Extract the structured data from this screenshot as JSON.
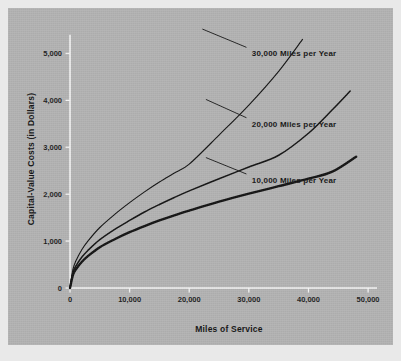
{
  "figure": {
    "panel_color": "#b2b2b2",
    "page_color": "#e9e9e9",
    "axis_color": "#f4f4f4",
    "ink_color": "#121212"
  },
  "chart_data": {
    "type": "line",
    "title": "",
    "subtitle": "",
    "xlabel": "Miles of Service",
    "ylabel": "Capital-Value Costs (in Dollars)",
    "xlim": [
      0,
      52000
    ],
    "ylim": [
      0,
      5500
    ],
    "xticks": [
      0,
      10000,
      20000,
      30000,
      40000,
      50000
    ],
    "xticklabels": [
      "0",
      "10,000",
      "20,000",
      "30,000",
      "40,000",
      "50,000"
    ],
    "yticks": [
      0,
      1000,
      2000,
      3000,
      4000,
      5000
    ],
    "yticklabels": [
      "0",
      "1,000",
      "2,000",
      "3,000",
      "4,000",
      "5,000"
    ],
    "grid": false,
    "legend_position": "inline-annotations",
    "series": [
      {
        "name": "10,000 Miles per Year",
        "label": "10,000 Miles per Year",
        "stroke_width": 2.4,
        "label_x": 30500,
        "label_y": 2300,
        "leader_from": [
          29600,
          2430
        ],
        "leader_to": [
          22800,
          2780
        ],
        "x": [
          0,
          500,
          1000,
          2000,
          3000,
          5000,
          7500,
          10000,
          12500,
          15000,
          17500,
          20000,
          25000,
          30000,
          35000,
          40000,
          44000,
          48000
        ],
        "y": [
          0,
          280,
          400,
          560,
          680,
          870,
          1040,
          1190,
          1320,
          1440,
          1550,
          1650,
          1840,
          2010,
          2170,
          2330,
          2480,
          2800
        ]
      },
      {
        "name": "20,000 Miles per Year",
        "label": "20,000 Miles per Year",
        "stroke_width": 1.5,
        "label_x": 30500,
        "label_y": 3500,
        "leader_from": [
          29600,
          3630
        ],
        "leader_to": [
          22800,
          4020
        ],
        "x": [
          0,
          500,
          1000,
          2000,
          3000,
          5000,
          7500,
          10000,
          12500,
          15000,
          17500,
          20000,
          25000,
          30000,
          35000,
          40000,
          44000,
          47000
        ],
        "y": [
          0,
          330,
          470,
          660,
          800,
          1030,
          1250,
          1440,
          1620,
          1780,
          1930,
          2070,
          2330,
          2580,
          2830,
          3300,
          3800,
          4200
        ]
      },
      {
        "name": "30,000 Miles per Year",
        "label": "30,000 Miles per Year",
        "stroke_width": 1.1,
        "label_x": 30500,
        "label_y": 5000,
        "leader_from": [
          29600,
          5130
        ],
        "leader_to": [
          22200,
          5520
        ],
        "x": [
          0,
          500,
          1000,
          2000,
          3000,
          5000,
          7500,
          10000,
          12500,
          15000,
          17500,
          20000,
          25000,
          30000,
          35000,
          39000
        ],
        "y": [
          0,
          400,
          580,
          820,
          1000,
          1290,
          1570,
          1820,
          2050,
          2260,
          2450,
          2640,
          3260,
          3900,
          4620,
          5300
        ]
      }
    ]
  }
}
